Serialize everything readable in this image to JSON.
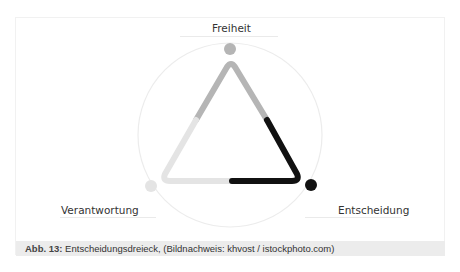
{
  "diagram": {
    "title": "Entscheidungsdreieck",
    "labels": {
      "top": "Freiheit",
      "left": "Verantwortung",
      "right": "Entscheidung"
    },
    "colors": {
      "freiheit": "#b5b5b5",
      "verantwortung": "#e4e4e4",
      "entscheidung": "#111111",
      "circle": "#ececec"
    }
  },
  "caption": {
    "prefix": "Abb. 13:",
    "text": " Entscheidungsdreieck, (Bildnachweis: khvost / istockphoto.com)"
  }
}
